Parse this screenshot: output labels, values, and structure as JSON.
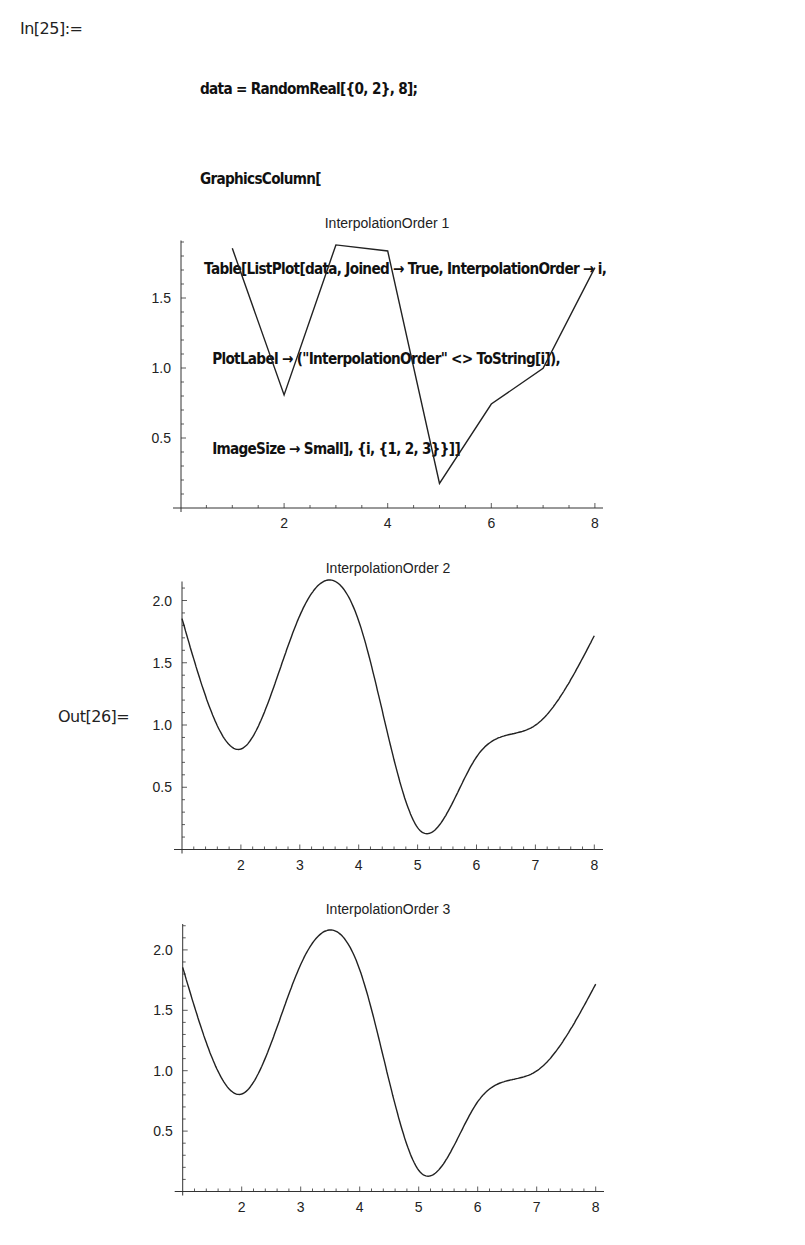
{
  "notebook": {
    "input_label": "In[25]:=",
    "output_label": "Out[26]=",
    "code_lines": [
      "data = RandomReal[{0, 2}, 8];",
      "GraphicsColumn[",
      " Table[ListPlot[data, Joined → True, InterpolationOrder → i,",
      "   PlotLabel → (\"InterpolationOrder\" <> ToString[i]),",
      "   ImageSize → Small], {i, {1, 2, 3}}]]"
    ]
  },
  "chart_data": [
    {
      "type": "line",
      "title": "InterpolationOrder 1",
      "interpolation_order": 1,
      "x": [
        1,
        2,
        3,
        4,
        5,
        6,
        7,
        8
      ],
      "values": [
        1.855,
        0.807,
        1.879,
        1.836,
        0.176,
        0.743,
        0.998,
        1.717
      ],
      "xlabel": "",
      "ylabel": "",
      "xticks": [
        2,
        4,
        6,
        8
      ],
      "yticks": [
        0.5,
        1.0,
        1.5
      ],
      "ytick_labels": [
        "0.5",
        "1.0",
        "1.5"
      ],
      "xlim": [
        0,
        8.2
      ],
      "ylim": [
        0,
        1.93
      ],
      "grid": false,
      "legend": null
    },
    {
      "type": "line",
      "title": "InterpolationOrder 2",
      "interpolation_order": 2,
      "x": [
        1,
        2,
        3,
        4,
        5,
        6,
        7,
        8
      ],
      "values": [
        1.855,
        0.807,
        1.879,
        1.836,
        0.176,
        0.743,
        0.998,
        1.717
      ],
      "curve_extrema": {
        "min1": [
          2.0,
          0.81
        ],
        "max1": [
          3.5,
          2.12
        ],
        "min2": [
          5.17,
          0.12
        ],
        "plateau": [
          6.5,
          0.885
        ]
      },
      "xlabel": "",
      "ylabel": "",
      "xticks": [
        2,
        3,
        4,
        5,
        6,
        7,
        8
      ],
      "yticks": [
        0.5,
        1.0,
        1.5,
        2.0
      ],
      "ytick_labels": [
        "0.5",
        "1.0",
        "1.5",
        "2.0"
      ],
      "xlim": [
        1,
        8.15
      ],
      "ylim": [
        0,
        2.15
      ],
      "grid": false,
      "legend": null
    },
    {
      "type": "line",
      "title": "InterpolationOrder 3",
      "interpolation_order": 3,
      "x": [
        1,
        2,
        3,
        4,
        5,
        6,
        7,
        8
      ],
      "values": [
        1.855,
        0.807,
        1.879,
        1.836,
        0.176,
        0.743,
        0.998,
        1.717
      ],
      "curve_extrema": {
        "min1": [
          2.0,
          0.81
        ],
        "max1": [
          3.5,
          2.18
        ],
        "min2": [
          5.15,
          0.13
        ],
        "plateau": [
          6.5,
          0.9
        ]
      },
      "xlabel": "",
      "ylabel": "",
      "xticks": [
        2,
        3,
        4,
        5,
        6,
        7,
        8
      ],
      "yticks": [
        0.5,
        1.0,
        1.5,
        2.0
      ],
      "ytick_labels": [
        "0.5",
        "1.0",
        "1.5",
        "2.0"
      ],
      "xlim": [
        1,
        8.15
      ],
      "ylim": [
        0,
        2.22
      ],
      "grid": false,
      "legend": null
    }
  ]
}
